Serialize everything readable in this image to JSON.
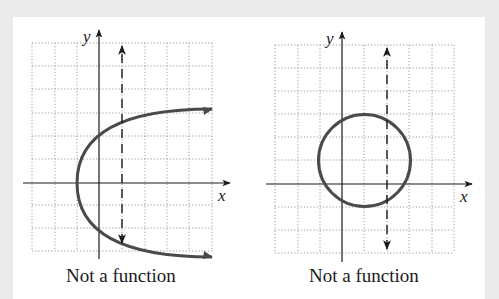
{
  "figures": [
    {
      "id": "parabola",
      "shape": "sideways parabola opening right",
      "axis_labels": {
        "x": "x",
        "y": "y"
      },
      "caption": "Not a function",
      "vertical_line_test": "dashed vertical line intersects curve at two points"
    },
    {
      "id": "circle",
      "shape": "circle",
      "axis_labels": {
        "x": "x",
        "y": "y"
      },
      "caption": "Not a function",
      "vertical_line_test": "dashed vertical line intersects curve at two points"
    }
  ],
  "colors": {
    "background": "#ebebeb",
    "panel": "#ffffff",
    "curve": "#4a4a4a",
    "axis": "#1a1a1a",
    "grid": "#9a9a9a"
  }
}
